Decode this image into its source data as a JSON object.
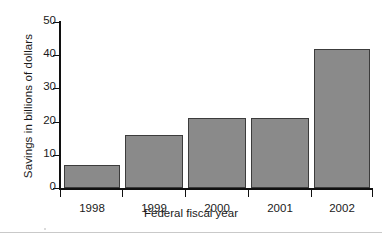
{
  "chart_data": {
    "type": "bar",
    "title": "",
    "subtitle": "",
    "xlabel": "Federal fiscal year",
    "ylabel": "Savings in billions of dollars",
    "categories": [
      "1998",
      "1999",
      "2000",
      "2001",
      "2002"
    ],
    "values": [
      7,
      16,
      21,
      21,
      42
    ],
    "series": [
      {
        "name": "Savings",
        "values": [
          7,
          16,
          21,
          21,
          42
        ]
      }
    ],
    "ylim": [
      0,
      50
    ],
    "yticks": [
      0,
      10,
      20,
      30,
      40,
      50
    ],
    "ytick_labels": [
      "0",
      "10",
      "20",
      "30",
      "40",
      "50"
    ],
    "xtick_labels": [
      "1998",
      "1999",
      "2000",
      "2001",
      "2002"
    ],
    "grid": false,
    "legend": false,
    "legend_position": "none",
    "bar_color": "#8a8a8a",
    "bar_edge_color": "#3c3c3c",
    "axis_color": "#101010",
    "background_color": "#ffffff",
    "units": "billions of dollars"
  }
}
